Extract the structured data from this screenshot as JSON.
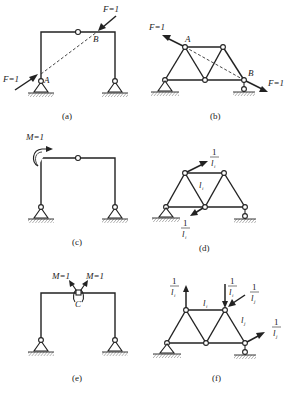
{
  "figure": {
    "panels": [
      {
        "id": "a",
        "caption": "(a)",
        "type": "three-hinged frame",
        "labels": {
          "load_top": "F=1",
          "load_left": "F=1",
          "point_a": "A",
          "point_b": "B"
        }
      },
      {
        "id": "b",
        "caption": "(b)",
        "type": "truss",
        "labels": {
          "load_left": "F=1",
          "load_right": "F=1",
          "point_a": "A",
          "point_b": "B"
        }
      },
      {
        "id": "c",
        "caption": "(c)",
        "type": "three-hinged frame",
        "labels": {
          "moment": "M=1"
        }
      },
      {
        "id": "d",
        "caption": "(d)",
        "type": "truss",
        "labels": {
          "force_top_num": "1",
          "force_top_den": "l",
          "force_top_sub": "i",
          "member": "l",
          "member_sub": "i",
          "force_bot_num": "1",
          "force_bot_den": "l",
          "force_bot_sub": "i"
        }
      },
      {
        "id": "e",
        "caption": "(e)",
        "type": "three-hinged frame",
        "labels": {
          "moment_left": "M=1",
          "moment_right": "M=1",
          "point_c": "C"
        }
      },
      {
        "id": "f",
        "caption": "(f)",
        "type": "truss",
        "labels": {
          "f1_num": "1",
          "f1_den": "l",
          "f1_sub": "i",
          "f2_num": "1",
          "f2_den": "l",
          "f2_sub": "i",
          "f3_num": "1",
          "f3_den": "l",
          "f3_sub": "j",
          "f4_num": "1",
          "f4_den": "l",
          "f4_sub": "j",
          "member_i": "l",
          "member_i_sub": "i",
          "member_j": "l",
          "member_j_sub": "j"
        }
      }
    ]
  }
}
